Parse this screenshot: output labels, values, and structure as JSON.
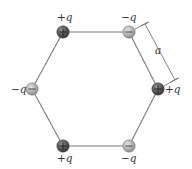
{
  "figure": {
    "type": "hexagon-charge-arrangement",
    "edge_length_label": "a",
    "colors": {
      "background": "#ffffff",
      "edge": "#7a7a7a",
      "positive_fill": "#555555",
      "negative_fill": "#b0b0b0",
      "text": "#333333"
    }
  },
  "charges": [
    {
      "id": "top-left",
      "sign": "+",
      "label": "+q",
      "glyph": "+",
      "x": 63,
      "y": 32
    },
    {
      "id": "top-right",
      "sign": "-",
      "label": "−q",
      "glyph": "−",
      "x": 129,
      "y": 32
    },
    {
      "id": "right",
      "sign": "+",
      "label": "+q",
      "glyph": "+",
      "x": 158,
      "y": 89
    },
    {
      "id": "bottom-right",
      "sign": "-",
      "label": "−q",
      "glyph": "−",
      "x": 129,
      "y": 146
    },
    {
      "id": "bottom-left",
      "sign": "+",
      "label": "+q",
      "glyph": "+",
      "x": 63,
      "y": 146
    },
    {
      "id": "left",
      "sign": "-",
      "label": "−q",
      "glyph": "−",
      "x": 32,
      "y": 89
    }
  ],
  "labels": {
    "top_left": "+q",
    "top_right": "−q",
    "right": "+q",
    "bottom_right": "−q",
    "bottom_left": "+q",
    "left": "−q",
    "dimension": "a"
  }
}
